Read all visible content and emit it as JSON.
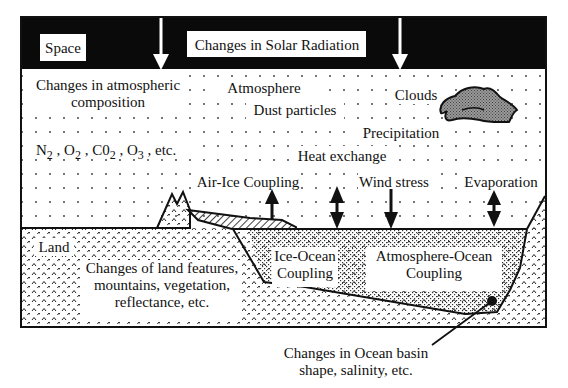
{
  "diagram": {
    "top_band": {
      "space_label": "Space",
      "solar_label": "Changes in Solar Radiation",
      "band_color": "#0a0a0a"
    },
    "atmosphere": {
      "composition_line1": "Changes in atmospheric",
      "composition_line2": "composition",
      "gases": {
        "n2": "N",
        "n2_sub": "2",
        "o2": "O",
        "o2_sub": "2",
        "co2": "C0",
        "co2_sub": "2",
        "o3": "O",
        "o3_sub": "3",
        "etc": "etc.",
        "sep": ","
      },
      "atmosphere_label": "Atmosphere",
      "clouds_label": "Clouds",
      "dust_label": "Dust particles",
      "precipitation_label": "Precipitation",
      "heat_exchange_label": "Heat exchange",
      "air_ice_label": "Air-Ice Coupling",
      "wind_stress_label": "Wind stress",
      "evaporation_label": "Evaporation"
    },
    "land": {
      "land_label": "Land",
      "features_line1": "Changes of land features,",
      "features_line2": "mountains, vegetation,",
      "features_line3": "reflectance, etc."
    },
    "ocean": {
      "ice_ocean_line1": "Ice-Ocean",
      "ice_ocean_line2": "Coupling",
      "atm_ocean_line1": "Atmosphere-Ocean",
      "atm_ocean_line2": "Coupling",
      "basin_line1": "Changes in Ocean basin",
      "basin_line2": "shape, salinity, etc."
    },
    "colors": {
      "cloud_fill": "#8a8a8a",
      "ink": "#111111",
      "background": "#ffffff"
    }
  }
}
